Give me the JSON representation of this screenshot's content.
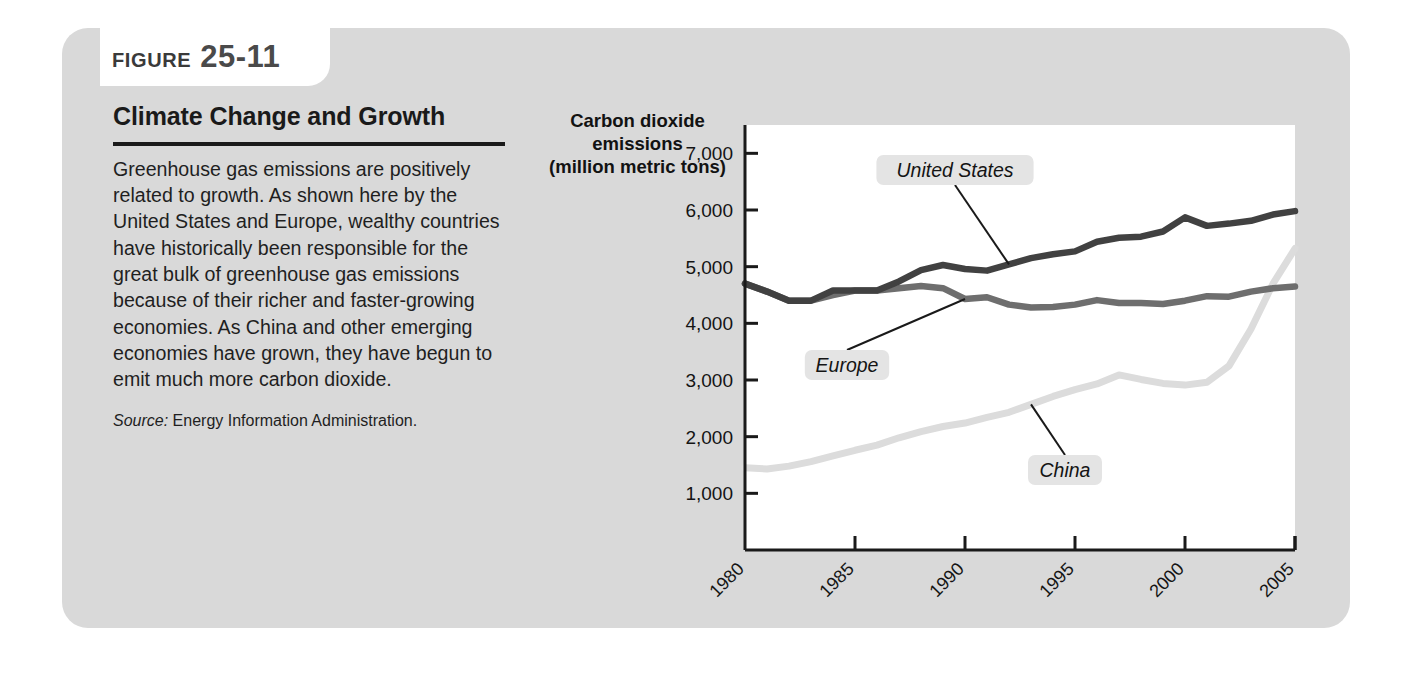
{
  "figure": {
    "label_word": "FIGURE",
    "number": "25-11",
    "title": "Climate Change and Growth",
    "body": "Greenhouse gas emissions are positively related to growth. As shown here by the United States and Europe, wealthy countries have historically been responsible for the great bulk of greenhouse gas emissions because of their richer and faster-growing economies. As China and other emerging economies have grown, they have begun to emit much more carbon dioxide.",
    "source_label": "Source:",
    "source_text": "Energy Information Administration."
  },
  "colors": {
    "panel": "#d9d9d9",
    "badge": "#ffffff",
    "plot_background": "#ffffff",
    "axis": "#1a1a1a",
    "united_states": "#414141",
    "europe": "#6e6e6e",
    "china": "#dcdcdc",
    "label_chip": "#e4e4e4",
    "leader_line": "#1a1a1a"
  },
  "chart_data": {
    "type": "line",
    "title": "Climate Change and Growth",
    "ylabel": "Carbon dioxide emissions (million metric tons)",
    "ylabel_lines": [
      "Carbon dioxide",
      "emissions",
      "(million metric tons)"
    ],
    "xlabel": "Year",
    "xlim": [
      1980,
      2005
    ],
    "ylim": [
      0,
      7500
    ],
    "ytick_labels": [
      "7,000",
      "6,000",
      "5,000",
      "4,000",
      "3,000",
      "2,000",
      "1,000"
    ],
    "yticks": [
      7000,
      6000,
      5000,
      4000,
      3000,
      2000,
      1000
    ],
    "xtick_labels": [
      "1980",
      "1985",
      "1990",
      "1995",
      "2000",
      "2005"
    ],
    "xticks": [
      1980,
      1985,
      1990,
      1995,
      2000,
      2005
    ],
    "grid": false,
    "legend": "inline-annotations",
    "x": [
      1980,
      1981,
      1982,
      1983,
      1984,
      1985,
      1986,
      1987,
      1988,
      1989,
      1990,
      1991,
      1992,
      1993,
      1994,
      1995,
      1996,
      1997,
      1998,
      1999,
      2000,
      2001,
      2002,
      2003,
      2004,
      2005
    ],
    "series": [
      {
        "name": "United States",
        "color": "#414141",
        "values": [
          4700,
          4560,
          4400,
          4400,
          4580,
          4580,
          4580,
          4740,
          4940,
          5030,
          4960,
          4930,
          5040,
          5150,
          5220,
          5270,
          5440,
          5510,
          5530,
          5620,
          5870,
          5720,
          5760,
          5810,
          5920,
          5980
        ]
      },
      {
        "name": "Europe",
        "color": "#6e6e6e",
        "values": [
          4700,
          4560,
          4400,
          4400,
          4500,
          4580,
          4580,
          4620,
          4660,
          4620,
          4430,
          4460,
          4330,
          4280,
          4290,
          4330,
          4410,
          4360,
          4360,
          4340,
          4400,
          4480,
          4470,
          4560,
          4620,
          4650
        ]
      },
      {
        "name": "China",
        "color": "#dcdcdc",
        "values": [
          1450,
          1430,
          1480,
          1560,
          1660,
          1760,
          1850,
          1980,
          2090,
          2180,
          2240,
          2340,
          2430,
          2570,
          2710,
          2830,
          2930,
          3090,
          3010,
          2940,
          2910,
          2960,
          3250,
          3900,
          4700,
          5320
        ]
      }
    ],
    "annotations": [
      {
        "text": "United States",
        "series": "United States"
      },
      {
        "text": "Europe",
        "series": "Europe"
      },
      {
        "text": "China",
        "series": "China"
      }
    ]
  }
}
